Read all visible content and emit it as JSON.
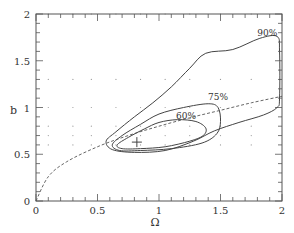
{
  "chart_data": {
    "type": "contour",
    "title": "",
    "xlabel": "Ω",
    "ylabel": "b",
    "xlim": [
      0,
      2
    ],
    "ylim": [
      0,
      2
    ],
    "xticks": [
      "0",
      "0.5",
      "1",
      "1.5",
      "2"
    ],
    "yticks": [
      "0",
      "0.5",
      "1",
      "1.5",
      "2"
    ],
    "grid": "dotted points",
    "best_fit": {
      "x": 0.82,
      "y": 0.63,
      "marker": "+"
    },
    "contours": [
      {
        "label": "60%",
        "label_pos": [
          1.22,
          0.88
        ],
        "points": [
          [
            0.66,
            0.6
          ],
          [
            0.75,
            0.68
          ],
          [
            0.88,
            0.77
          ],
          [
            1.0,
            0.84
          ],
          [
            1.15,
            0.87
          ],
          [
            1.3,
            0.85
          ],
          [
            1.38,
            0.78
          ],
          [
            1.36,
            0.7
          ],
          [
            1.25,
            0.64
          ],
          [
            1.05,
            0.58
          ],
          [
            0.85,
            0.56
          ],
          [
            0.7,
            0.56
          ],
          [
            0.66,
            0.6
          ]
        ]
      },
      {
        "label": "75%",
        "label_pos": [
          1.48,
          1.08
        ],
        "points": [
          [
            0.62,
            0.6
          ],
          [
            0.7,
            0.7
          ],
          [
            0.85,
            0.82
          ],
          [
            1.0,
            0.93
          ],
          [
            1.2,
            1.0
          ],
          [
            1.4,
            1.04
          ],
          [
            1.48,
            1.0
          ],
          [
            1.5,
            0.85
          ],
          [
            1.47,
            0.72
          ],
          [
            1.35,
            0.62
          ],
          [
            1.1,
            0.56
          ],
          [
            0.85,
            0.54
          ],
          [
            0.68,
            0.54
          ],
          [
            0.62,
            0.6
          ]
        ]
      },
      {
        "label": "90%",
        "label_pos": [
          1.88,
          1.77
        ],
        "points": [
          [
            0.57,
            0.64
          ],
          [
            0.65,
            0.74
          ],
          [
            0.8,
            0.9
          ],
          [
            0.95,
            1.05
          ],
          [
            1.1,
            1.22
          ],
          [
            1.25,
            1.42
          ],
          [
            1.38,
            1.58
          ],
          [
            1.6,
            1.62
          ],
          [
            1.82,
            1.74
          ],
          [
            1.96,
            1.76
          ],
          [
            1.98,
            1.6
          ],
          [
            1.98,
            1.1
          ],
          [
            1.96,
            1.0
          ],
          [
            1.85,
            0.92
          ],
          [
            1.65,
            0.84
          ],
          [
            1.45,
            0.75
          ],
          [
            1.28,
            0.64
          ],
          [
            1.05,
            0.54
          ],
          [
            0.8,
            0.52
          ],
          [
            0.62,
            0.55
          ],
          [
            0.57,
            0.64
          ]
        ]
      }
    ],
    "dashed_curve": {
      "description": "b ∝ Ω^0.6",
      "points": [
        [
          0,
          0
        ],
        [
          0.1,
          0.26
        ],
        [
          0.25,
          0.42
        ],
        [
          0.5,
          0.58
        ],
        [
          0.75,
          0.7
        ],
        [
          1.0,
          0.8
        ],
        [
          1.25,
          0.89
        ],
        [
          1.5,
          0.97
        ],
        [
          1.75,
          1.05
        ],
        [
          2.0,
          1.12
        ]
      ]
    },
    "grid_points_x": [
      0.1,
      0.3,
      0.45,
      0.65,
      0.85,
      1.05,
      1.25,
      1.5,
      1.75
    ],
    "grid_points_y": [
      0.6,
      0.7,
      0.8,
      1.0,
      1.3,
      2.0
    ]
  }
}
